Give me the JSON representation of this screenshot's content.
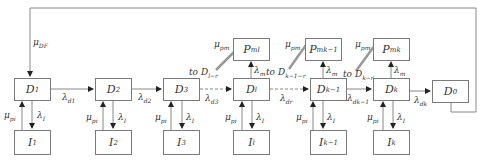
{
  "diagram": {
    "type": "state-transition-flow",
    "feedback": {
      "label": "μ",
      "sub": "DF",
      "from": "D0",
      "to": "D1"
    },
    "d_nodes": [
      {
        "id": "D1",
        "main": "D",
        "sub": "1"
      },
      {
        "id": "D2",
        "main": "D",
        "sub": "2"
      },
      {
        "id": "D3",
        "main": "D",
        "sub": "3"
      },
      {
        "id": "Dl",
        "main": "D",
        "sub": "l"
      },
      {
        "id": "Dk-1",
        "main": "D",
        "sub": "k−1"
      },
      {
        "id": "Dk",
        "main": "D",
        "sub": "k"
      },
      {
        "id": "D0",
        "main": "D",
        "sub": "0"
      }
    ],
    "i_nodes": [
      {
        "id": "I1",
        "main": "I",
        "sub": "1"
      },
      {
        "id": "I2",
        "main": "I",
        "sub": "2"
      },
      {
        "id": "I3",
        "main": "I",
        "sub": "3"
      },
      {
        "id": "Il",
        "main": "I",
        "sub": "l"
      },
      {
        "id": "Ik-1",
        "main": "I",
        "sub": "k−1"
      },
      {
        "id": "Ik",
        "main": "I",
        "sub": "k"
      }
    ],
    "p_nodes": [
      {
        "id": "Pml",
        "main": "P",
        "sub": "ml"
      },
      {
        "id": "Pmk-1",
        "main": "P",
        "sub": "mk−1"
      },
      {
        "id": "Pmk",
        "main": "P",
        "sub": "mk"
      }
    ],
    "forward_edges": [
      {
        "main": "λ",
        "sub": "d1"
      },
      {
        "main": "λ",
        "sub": "d2"
      },
      {
        "main": "λ",
        "sub": "d3"
      },
      {
        "main": "λ",
        "sub": "dr"
      },
      {
        "main": "λ",
        "sub": "dk−1"
      },
      {
        "main": "λ",
        "sub": "dk"
      }
    ],
    "repair_label": {
      "main": "μ",
      "sub": "pi"
    },
    "inspect_label": {
      "main": "λ",
      "sub": "I"
    },
    "maint_label": {
      "main": "λ",
      "sub": "m"
    },
    "pm_label": {
      "main": "μ",
      "sub": "pm"
    },
    "pm_targets": [
      {
        "prefix": "to ",
        "main": "D",
        "sub": "l−r"
      },
      {
        "prefix": "to ",
        "main": "D",
        "sub": "k−1−r"
      },
      {
        "prefix": "to ",
        "main": "D",
        "sub": "k−r"
      }
    ]
  }
}
